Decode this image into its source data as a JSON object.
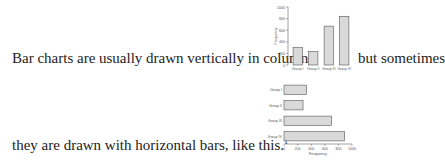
{
  "text": {
    "line1_before": "Bar charts are usually drawn vertically in columns,",
    "line1_after": "but sometimes",
    "line2": "they are drawn with horizontal bars, like this.",
    "footnote_marker": "1"
  },
  "chart_data": [
    {
      "type": "bar",
      "orientation": "vertical",
      "categories": [
        "Group I",
        "Group II",
        "Group III",
        "Group IV"
      ],
      "values": [
        300,
        230,
        670,
        840
      ],
      "title": "",
      "xlabel": "",
      "ylabel": "Frequency",
      "ylim": [
        0,
        1000
      ],
      "yticks": [
        0,
        200,
        400,
        600,
        800,
        1000
      ],
      "grid": false,
      "bar_color": "#d9d9d9",
      "edge_color": "#555555"
    },
    {
      "type": "bar",
      "orientation": "horizontal",
      "categories": [
        "Group I",
        "Group II",
        "Group III",
        "Group IV"
      ],
      "values": [
        330,
        280,
        700,
        890
      ],
      "title": "",
      "xlabel": "Frequency",
      "ylabel": "",
      "xlim": [
        0,
        1000
      ],
      "xticks": [
        0,
        200,
        400,
        600,
        800,
        1000
      ],
      "grid": false,
      "bar_color": "#d9d9d9",
      "edge_color": "#555555"
    }
  ]
}
